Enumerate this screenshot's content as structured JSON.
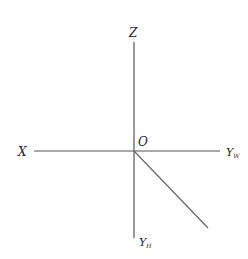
{
  "diagram": {
    "background": "#ffffff",
    "line_color": "#555555",
    "text_color": "#222222",
    "origin": {
      "label": "O",
      "x": 134,
      "y": 151
    },
    "axes": [
      {
        "id": "z",
        "label": "Z",
        "subscript": "",
        "from": [
          134,
          42
        ],
        "to": [
          134,
          151
        ]
      },
      {
        "id": "x",
        "label": "X",
        "subscript": "",
        "from": [
          34,
          151
        ],
        "to": [
          134,
          151
        ]
      },
      {
        "id": "yw",
        "label": "Y",
        "subscript": "W",
        "from": [
          134,
          151
        ],
        "to": [
          220,
          151
        ]
      },
      {
        "id": "yh",
        "label": "Y",
        "subscript": "H",
        "from": [
          134,
          151
        ],
        "to": [
          134,
          238
        ]
      },
      {
        "id": "diagonal",
        "label": "",
        "subscript": "",
        "from": [
          134,
          151
        ],
        "to": [
          208,
          228
        ]
      }
    ]
  },
  "labels": {
    "z": "Z",
    "x": "X",
    "o": "O",
    "yw_main": "Y",
    "yw_sub": "W",
    "yh_main": "Y",
    "yh_sub": "H"
  }
}
